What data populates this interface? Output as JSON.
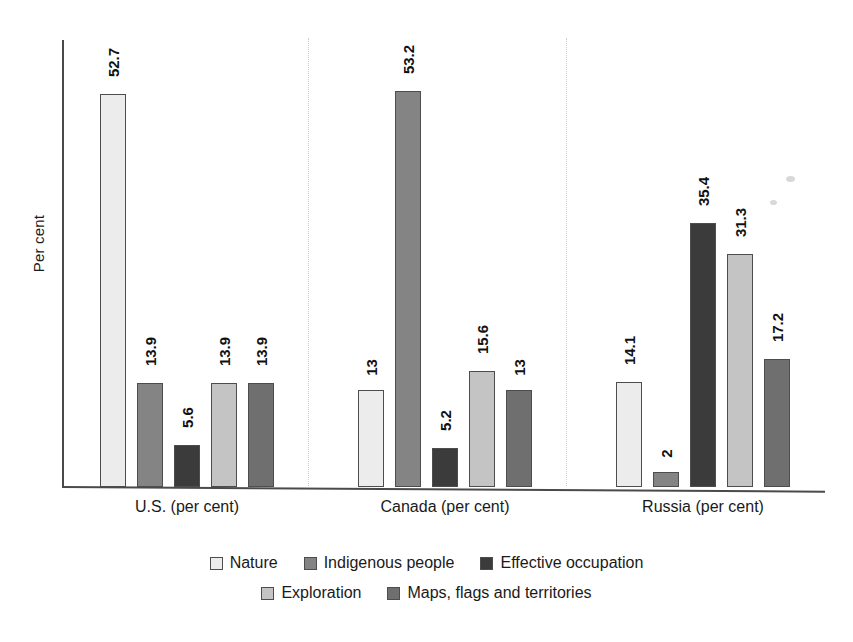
{
  "chart_data": {
    "type": "bar",
    "title": "",
    "subtitle": "",
    "xlabel": "",
    "ylabel": "Per cent",
    "ylim": [
      0,
      60
    ],
    "grid": false,
    "legend_position": "bottom",
    "categories": [
      "U.S. (per cent)",
      "Canada (per cent)",
      "Russia (per cent)"
    ],
    "series": [
      {
        "name": "Nature",
        "color": "#ececec",
        "values": [
          52.7,
          13,
          14.1
        ],
        "labels": [
          "52.7",
          "13",
          "14.1"
        ]
      },
      {
        "name": "Indigenous people",
        "color": "#848484",
        "values": [
          13.9,
          53.2,
          2
        ],
        "labels": [
          "13.9",
          "53.2",
          "2"
        ]
      },
      {
        "name": "Effective occupation",
        "color": "#3b3b3b",
        "values": [
          5.6,
          5.2,
          35.4
        ],
        "labels": [
          "5.6",
          "5.2",
          "35.4"
        ]
      },
      {
        "name": "Exploration",
        "color": "#c4c4c4",
        "values": [
          13.9,
          15.6,
          31.3
        ],
        "labels": [
          "13.9",
          "15.6",
          "31.3"
        ]
      },
      {
        "name": "Maps, flags and territories",
        "color": "#6f6f6f",
        "values": [
          13.9,
          13,
          17.2
        ],
        "labels": [
          "13.9",
          "13",
          "17.2"
        ]
      }
    ]
  },
  "axis": {
    "y_title": "Per cent"
  },
  "legend": {
    "row1": [
      "Nature",
      "Indigenous people",
      "Effective occupation"
    ],
    "row2": [
      "Exploration",
      "Maps, flags and territories"
    ]
  }
}
